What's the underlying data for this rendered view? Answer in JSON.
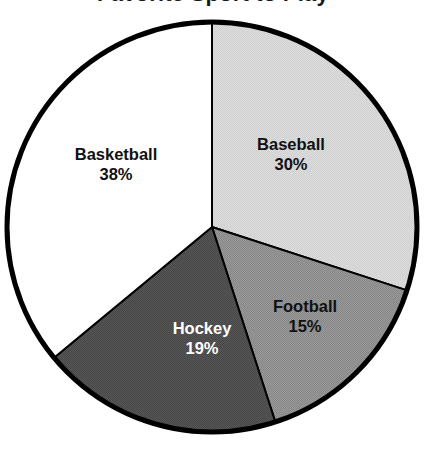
{
  "chart_data": {
    "type": "pie",
    "title": "Favorite Sport to Play",
    "title_cropped": true,
    "labels": [
      "Baseball",
      "Football",
      "Hockey",
      "Basketball"
    ],
    "values": [
      30,
      15,
      19,
      38
    ],
    "value_suffix": "%",
    "value_labels": [
      "30%",
      "15%",
      "19%",
      "38%"
    ],
    "colors": [
      "#d8d8d8",
      "#919191",
      "#505050",
      "#ffffff"
    ],
    "label_text_colors": [
      "#111111",
      "#111111",
      "#ffffff",
      "#111111"
    ],
    "start_angle_deg": 0,
    "direction": "clockwise",
    "stroke_color": "#000000",
    "outer_stroke_width": 5,
    "divider_stroke_width": 2,
    "legend": "none",
    "grid": false,
    "slices": [
      {
        "label": "Baseball",
        "value": 30,
        "value_label": "30%",
        "color": "#d8d8d8",
        "text_color": "#111111",
        "start_deg": 0,
        "end_deg": 108
      },
      {
        "label": "Football",
        "value": 15,
        "value_label": "15%",
        "color": "#919191",
        "text_color": "#111111",
        "start_deg": 108,
        "end_deg": 162
      },
      {
        "label": "Hockey",
        "value": 19,
        "value_label": "19%",
        "color": "#505050",
        "text_color": "#ffffff",
        "start_deg": 162,
        "end_deg": 230.4
      },
      {
        "label": "Basketball",
        "value": 38,
        "value_label": "38%",
        "color": "#ffffff",
        "text_color": "#111111",
        "start_deg": 230.4,
        "end_deg": 360
      }
    ],
    "geometry": {
      "center_x": 212,
      "center_y": 227,
      "radius": 205
    }
  }
}
